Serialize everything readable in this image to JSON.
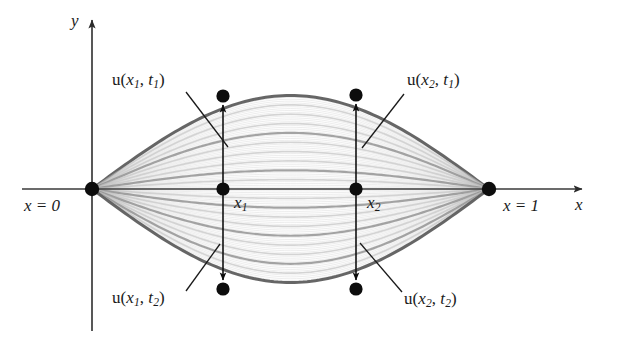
{
  "figure": {
    "background_color": "#ffffff",
    "axis_color": "#3a3a3a",
    "marker_color": "#0d0d0d",
    "curve_color_dark": "#6e6e6e",
    "curve_color_light": "#c8c8c8"
  },
  "axes": {
    "y_label": "y",
    "x_label": "x",
    "x_axis_y": 189,
    "y_axis_x": 92,
    "origin_label": "x = 0",
    "right_endpoint_label": "x = 1"
  },
  "labels": {
    "u_x1_t1": {
      "text": "u(x1, t1)",
      "base": "u(",
      "var": "x",
      "var_sub": "1",
      "sep": ", ",
      "time": "t",
      "time_sub": "1",
      "close": ")"
    },
    "u_x2_t1": {
      "text": "u(x2, t1)",
      "base": "u(",
      "var": "x",
      "var_sub": "2",
      "sep": ", ",
      "time": "t",
      "time_sub": "1",
      "close": ")"
    },
    "u_x1_t2": {
      "text": "u(x1, t2)",
      "base": "u(",
      "var": "x",
      "var_sub": "1",
      "sep": ", ",
      "time": "t",
      "time_sub": "2",
      "close": ")"
    },
    "u_x2_t2": {
      "text": "u(x2, t2)",
      "base": "u(",
      "var": "x",
      "var_sub": "2",
      "sep": ", ",
      "time": "t",
      "time_sub": "2",
      "close": ")"
    },
    "x1_tick": {
      "var": "x",
      "sub": "1"
    },
    "x2_tick": {
      "var": "x",
      "sub": "2"
    }
  },
  "points": [
    {
      "name": "origin",
      "label": "x = 0",
      "x": 92,
      "y": 189
    },
    {
      "name": "right-endpoint",
      "label": "x = 1",
      "x": 489,
      "y": 189
    },
    {
      "name": "u-x1-t1",
      "label": "u(x1, t1)",
      "x": 223,
      "y": 96
    },
    {
      "name": "x1-on-axis",
      "label": "x1",
      "x": 223,
      "y": 189
    },
    {
      "name": "u-x1-t2",
      "label": "u(x1, t2)",
      "x": 223,
      "y": 289
    },
    {
      "name": "u-x2-t1",
      "label": "u(x2, t1)",
      "x": 356,
      "y": 95
    },
    {
      "name": "x2-on-axis",
      "label": "x2",
      "x": 356,
      "y": 189
    },
    {
      "name": "u-x2-t2",
      "label": "u(x2, t2)",
      "x": 356,
      "y": 289
    }
  ],
  "chart_data": {
    "type": "line",
    "xlabel": "x",
    "ylabel": "y",
    "xlim": [
      0,
      1
    ],
    "ylim": [
      -1,
      1
    ],
    "grid": false,
    "legend": "none",
    "x": [
      0,
      0.05,
      0.1,
      0.15,
      0.2,
      0.25,
      0.3,
      0.35,
      0.4,
      0.45,
      0.5,
      0.55,
      0.6,
      0.65,
      0.7,
      0.75,
      0.8,
      0.85,
      0.9,
      0.95,
      1
    ],
    "amplitudes": [
      1.0,
      0.9,
      0.8,
      0.7,
      0.6,
      0.5,
      0.4,
      0.3,
      0.2,
      0.1,
      0.0,
      -0.1,
      -0.2,
      -0.3,
      -0.4,
      -0.5,
      -0.6,
      -0.7,
      -0.8,
      -0.9,
      -1.0
    ],
    "series": [
      {
        "name": "A = 1.0",
        "amplitude": 1.0,
        "shade": "dark"
      },
      {
        "name": "A = 0.9",
        "amplitude": 0.9,
        "shade": "light"
      },
      {
        "name": "A = 0.8",
        "amplitude": 0.8,
        "shade": "light"
      },
      {
        "name": "A = 0.7",
        "amplitude": 0.7,
        "shade": "light"
      },
      {
        "name": "A = 0.6",
        "amplitude": 0.6,
        "shade": "mid"
      },
      {
        "name": "A = 0.5",
        "amplitude": 0.5,
        "shade": "light"
      },
      {
        "name": "A = 0.4",
        "amplitude": 0.4,
        "shade": "light"
      },
      {
        "name": "A = 0.3",
        "amplitude": 0.3,
        "shade": "light"
      },
      {
        "name": "A = 0.2",
        "amplitude": 0.2,
        "shade": "mid"
      },
      {
        "name": "A = 0.1",
        "amplitude": 0.1,
        "shade": "light"
      },
      {
        "name": "A = 0.0",
        "amplitude": 0.0,
        "shade": "axis"
      },
      {
        "name": "A = -0.1",
        "amplitude": -0.1,
        "shade": "light"
      },
      {
        "name": "A = -0.2",
        "amplitude": -0.2,
        "shade": "mid"
      },
      {
        "name": "A = -0.3",
        "amplitude": -0.3,
        "shade": "light"
      },
      {
        "name": "A = -0.4",
        "amplitude": -0.4,
        "shade": "light"
      },
      {
        "name": "A = -0.5",
        "amplitude": -0.5,
        "shade": "mid"
      },
      {
        "name": "A = -0.6",
        "amplitude": -0.6,
        "shade": "light"
      },
      {
        "name": "A = -0.7",
        "amplitude": -0.7,
        "shade": "light"
      },
      {
        "name": "A = -0.8",
        "amplitude": -0.8,
        "shade": "mid"
      },
      {
        "name": "A = -0.9",
        "amplitude": -0.9,
        "shade": "light"
      },
      {
        "name": "A = -1.0",
        "amplitude": -1.0,
        "shade": "dark"
      }
    ],
    "annotations": [
      {
        "text": "u(x1, t1)",
        "x": 0.33,
        "y": 0.93
      },
      {
        "text": "u(x2, t1)",
        "x": 0.665,
        "y": 0.945
      },
      {
        "text": "u(x1, t2)",
        "x": 0.33,
        "y": -1.0
      },
      {
        "text": "u(x2, t2)",
        "x": 0.665,
        "y": -1.0
      },
      {
        "text": "x1",
        "x": 0.33,
        "y": 0
      },
      {
        "text": "x2",
        "x": 0.665,
        "y": 0
      },
      {
        "text": "x = 0",
        "x": 0.0,
        "y": 0
      },
      {
        "text": "x = 1",
        "x": 1.0,
        "y": 0
      }
    ]
  }
}
